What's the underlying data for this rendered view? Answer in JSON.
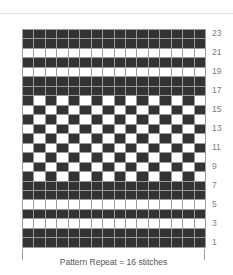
{
  "header": {
    "breadcrumb": "",
    "right_note": ""
  },
  "caption": "Pattern Repeat = 16 stitches",
  "row_labels": [
    "23",
    "21",
    "19",
    "17",
    "15",
    "13",
    "11",
    "9",
    "7",
    "5",
    "3",
    "1"
  ],
  "chart_data": {
    "type": "heatmap",
    "title": "",
    "subtitle": "",
    "xlabel": "",
    "ylabel": "",
    "legend": [],
    "grid": true,
    "columns": 16,
    "rows": 23,
    "colors": {
      "dark": "#333333",
      "light": "#ffffff",
      "gridline": "#9b9b9b"
    },
    "x_tick_labels": [],
    "y_tick_labels": [
      "1",
      "3",
      "5",
      "7",
      "9",
      "11",
      "13",
      "15",
      "17",
      "19",
      "21",
      "23"
    ],
    "row_label_side": "right",
    "annotations": [
      "Pattern Repeat = 16 stitches"
    ],
    "row_order": "top_to_bottom_row23_to_row1",
    "matrix": [
      [
        1,
        1,
        1,
        1,
        1,
        1,
        1,
        1,
        1,
        1,
        1,
        1,
        1,
        1,
        1,
        1
      ],
      [
        1,
        1,
        1,
        1,
        1,
        1,
        1,
        1,
        1,
        1,
        1,
        1,
        1,
        1,
        1,
        1
      ],
      [
        0,
        0,
        0,
        0,
        0,
        0,
        0,
        0,
        0,
        0,
        0,
        0,
        0,
        0,
        0,
        0
      ],
      [
        1,
        1,
        1,
        1,
        1,
        1,
        1,
        1,
        1,
        1,
        1,
        1,
        1,
        1,
        1,
        1
      ],
      [
        0,
        0,
        0,
        0,
        0,
        0,
        0,
        0,
        0,
        0,
        0,
        0,
        0,
        0,
        0,
        0
      ],
      [
        1,
        1,
        1,
        1,
        1,
        1,
        1,
        1,
        1,
        1,
        1,
        1,
        1,
        1,
        1,
        1
      ],
      [
        1,
        1,
        1,
        1,
        1,
        1,
        1,
        1,
        1,
        1,
        1,
        1,
        1,
        1,
        1,
        1
      ],
      [
        1,
        0,
        1,
        0,
        1,
        0,
        1,
        0,
        1,
        0,
        1,
        0,
        1,
        0,
        1,
        0
      ],
      [
        0,
        1,
        0,
        1,
        0,
        1,
        0,
        1,
        0,
        1,
        0,
        1,
        0,
        1,
        0,
        1
      ],
      [
        1,
        0,
        1,
        0,
        1,
        0,
        1,
        0,
        1,
        0,
        1,
        0,
        1,
        0,
        1,
        0
      ],
      [
        0,
        1,
        0,
        1,
        0,
        1,
        0,
        1,
        0,
        1,
        0,
        1,
        0,
        1,
        0,
        1
      ],
      [
        1,
        0,
        1,
        0,
        1,
        0,
        1,
        0,
        1,
        0,
        1,
        0,
        1,
        0,
        1,
        0
      ],
      [
        0,
        1,
        0,
        1,
        0,
        1,
        0,
        1,
        0,
        1,
        0,
        1,
        0,
        1,
        0,
        1
      ],
      [
        1,
        0,
        1,
        0,
        1,
        0,
        1,
        0,
        1,
        0,
        1,
        0,
        1,
        0,
        1,
        0
      ],
      [
        0,
        1,
        0,
        1,
        0,
        1,
        0,
        1,
        0,
        1,
        0,
        1,
        0,
        1,
        0,
        1
      ],
      [
        1,
        0,
        1,
        0,
        1,
        0,
        1,
        0,
        1,
        0,
        1,
        0,
        1,
        0,
        1,
        0
      ],
      [
        1,
        1,
        1,
        1,
        1,
        1,
        1,
        1,
        1,
        1,
        1,
        1,
        1,
        1,
        1,
        1
      ],
      [
        1,
        1,
        1,
        1,
        1,
        1,
        1,
        1,
        1,
        1,
        1,
        1,
        1,
        1,
        1,
        1
      ],
      [
        0,
        0,
        0,
        0,
        0,
        0,
        0,
        0,
        0,
        0,
        0,
        0,
        0,
        0,
        0,
        0
      ],
      [
        1,
        1,
        1,
        1,
        1,
        1,
        1,
        1,
        1,
        1,
        1,
        1,
        1,
        1,
        1,
        1
      ],
      [
        0,
        0,
        0,
        0,
        0,
        0,
        0,
        0,
        0,
        0,
        0,
        0,
        0,
        0,
        0,
        0
      ],
      [
        1,
        1,
        1,
        1,
        1,
        1,
        1,
        1,
        1,
        1,
        1,
        1,
        1,
        1,
        1,
        1
      ],
      [
        1,
        1,
        1,
        1,
        1,
        1,
        1,
        1,
        1,
        1,
        1,
        1,
        1,
        1,
        1,
        1
      ]
    ]
  }
}
